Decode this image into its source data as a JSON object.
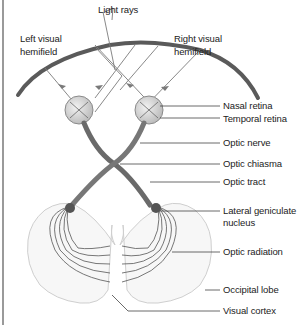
{
  "figure": {
    "top_labels": {
      "light_rays": "Light rays",
      "left_hemifield_line1": "Left visual",
      "left_hemifield_line2": "hemifield",
      "right_hemifield_line1": "Right visual",
      "right_hemifield_line2": "hemifield"
    },
    "right_labels": [
      {
        "id": "nasal-retina",
        "text": "Nasal retina"
      },
      {
        "id": "temporal-retina",
        "text": "Temporal retina"
      },
      {
        "id": "optic-nerve",
        "text": "Optic nerve"
      },
      {
        "id": "optic-chiasma",
        "text": "Optic chiasma"
      },
      {
        "id": "optic-tract",
        "text": "Optic tract"
      },
      {
        "id": "lateral-geniculate-line1",
        "text": "Lateral geniculate"
      },
      {
        "id": "lateral-geniculate-line2",
        "text": "nucleus"
      },
      {
        "id": "optic-radiation",
        "text": "Optic radiation"
      },
      {
        "id": "occipital-lobe",
        "text": "Occipital lobe"
      },
      {
        "id": "visual-cortex",
        "text": "Visual cortex"
      }
    ],
    "colors": {
      "nerve": "#6e6e6e",
      "arc": "#5a5a5a",
      "eye_fill": "#d9d9d9",
      "brain_fill": "#f7f7f7",
      "leader": "#444444"
    }
  }
}
